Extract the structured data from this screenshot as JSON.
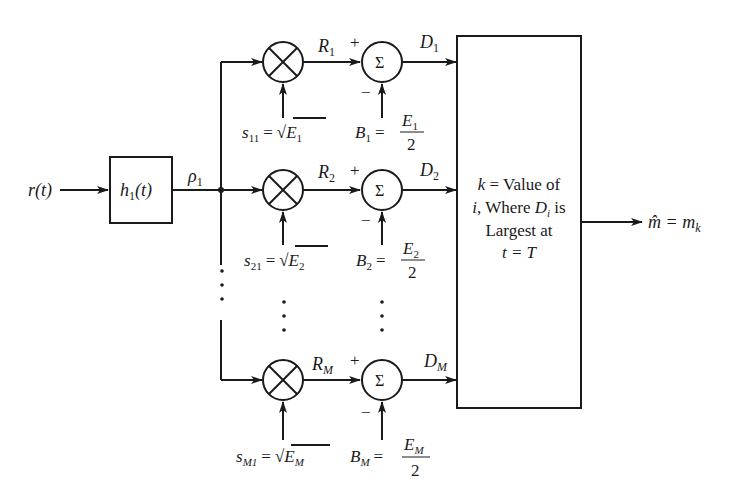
{
  "diagram": {
    "input_label": "r(t)",
    "filter_label": "h",
    "filter_sub": "1",
    "filter_arg": "(t)",
    "filter_output": "ρ",
    "filter_output_sub": "1",
    "branches": [
      {
        "mult_out": "R",
        "mult_out_sub": "1",
        "sum_out": "D",
        "sum_out_sub": "1",
        "s_label": "s",
        "s_sub": "11",
        "s_eq": "=",
        "s_val": "E",
        "s_val_sub": "1",
        "b_label": "B",
        "b_sub": "1",
        "b_eq": "=",
        "b_num": "E",
        "b_num_sub": "1",
        "b_den": "2",
        "plus": "+",
        "minus": "−"
      },
      {
        "mult_out": "R",
        "mult_out_sub": "2",
        "sum_out": "D",
        "sum_out_sub": "2",
        "s_label": "s",
        "s_sub": "21",
        "s_eq": "=",
        "s_val": "E",
        "s_val_sub": "2",
        "b_label": "B",
        "b_sub": "2",
        "b_eq": "=",
        "b_num": "E",
        "b_num_sub": "2",
        "b_den": "2",
        "plus": "+",
        "minus": "−"
      },
      {
        "mult_out": "R",
        "mult_out_sub": "M",
        "sum_out": "D",
        "sum_out_sub": "M",
        "s_label": "s",
        "s_sub": "M1",
        "s_eq": "=",
        "s_val": "E",
        "s_val_sub": "M",
        "b_label": "B",
        "b_sub": "M",
        "b_eq": "=",
        "b_num": "E",
        "b_num_sub": "M",
        "b_den": "2",
        "plus": "+",
        "minus": "−"
      }
    ],
    "sigma": "Σ",
    "decision_box": {
      "line1_k": "k",
      "line1_rest": " = Value of",
      "line2_i": "i",
      "line2_mid": ", Where ",
      "line2_D": "D",
      "line2_Dsub": "i",
      "line2_end": " is",
      "line3": "Largest at",
      "line4": "t = T"
    },
    "output_label": "m̂",
    "output_eq": " = m",
    "output_sub": "k",
    "ellipsis": "⋮"
  }
}
